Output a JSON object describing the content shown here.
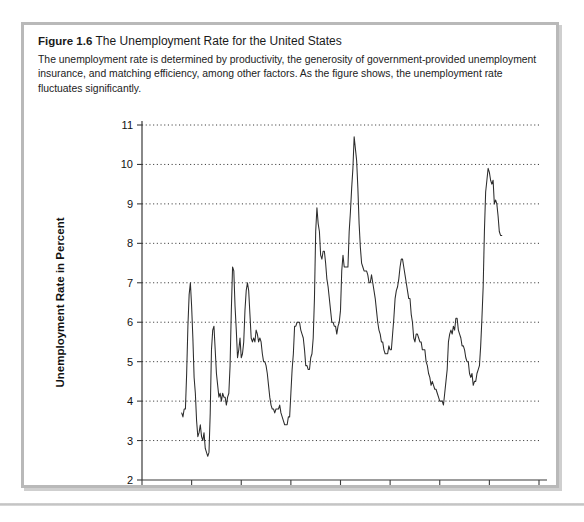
{
  "figure": {
    "number_label": "Figure 1.6",
    "title": "The Unemployment Rate for the United States",
    "description": "The unemployment rate is determined by productivity, the generosity of government-provided unemployment insurance, and matching efficiency, among other factors. As the figure shows, the unemployment rate fluctuates significantly."
  },
  "colors": {
    "card_background": "#ffffff",
    "card_border": "#b9b9b9",
    "line": "#2c2c2c",
    "grid": "#000000",
    "axis": "#3a3a3a",
    "text": "#111111"
  },
  "chart_data": {
    "type": "line",
    "title": "The Unemployment Rate for the United States",
    "xlabel": "Year",
    "ylabel": "Unemployment Rate in Percent",
    "xlim": [
      1940,
      2020
    ],
    "ylim": [
      2,
      11
    ],
    "xticks": [
      1940,
      1950,
      1960,
      1970,
      1980,
      1990,
      2000,
      2010,
      2020
    ],
    "yticks": [
      2,
      3,
      4,
      5,
      6,
      7,
      8,
      9,
      10,
      11
    ],
    "grid": "horizontal-dotted",
    "legend": "none",
    "series": [
      {
        "name": "Unemployment Rate",
        "x": [
          1948.0,
          1948.25,
          1948.5,
          1948.75,
          1949.0,
          1949.25,
          1949.5,
          1949.75,
          1950.0,
          1950.25,
          1950.5,
          1950.75,
          1951.0,
          1951.25,
          1951.5,
          1951.75,
          1952.0,
          1952.25,
          1952.5,
          1952.75,
          1953.0,
          1953.25,
          1953.5,
          1953.75,
          1954.0,
          1954.25,
          1954.5,
          1954.75,
          1955.0,
          1955.25,
          1955.5,
          1955.75,
          1956.0,
          1956.25,
          1956.5,
          1956.75,
          1957.0,
          1957.25,
          1957.5,
          1957.75,
          1958.0,
          1958.25,
          1958.5,
          1958.75,
          1959.0,
          1959.25,
          1959.5,
          1959.75,
          1960.0,
          1960.25,
          1960.5,
          1960.75,
          1961.0,
          1961.25,
          1961.5,
          1961.75,
          1962.0,
          1962.25,
          1962.5,
          1962.75,
          1963.0,
          1963.25,
          1963.5,
          1963.75,
          1964.0,
          1964.25,
          1964.5,
          1964.75,
          1965.0,
          1965.25,
          1965.5,
          1965.75,
          1966.0,
          1966.25,
          1966.5,
          1966.75,
          1967.0,
          1967.25,
          1967.5,
          1967.75,
          1968.0,
          1968.25,
          1968.5,
          1968.75,
          1969.0,
          1969.25,
          1969.5,
          1969.75,
          1970.0,
          1970.25,
          1970.5,
          1970.75,
          1971.0,
          1971.25,
          1971.5,
          1971.75,
          1972.0,
          1972.25,
          1972.5,
          1972.75,
          1973.0,
          1973.25,
          1973.5,
          1973.75,
          1974.0,
          1974.25,
          1974.5,
          1974.75,
          1975.0,
          1975.25,
          1975.5,
          1975.75,
          1976.0,
          1976.25,
          1976.5,
          1976.75,
          1977.0,
          1977.25,
          1977.5,
          1977.75,
          1978.0,
          1978.25,
          1978.5,
          1978.75,
          1979.0,
          1979.25,
          1979.5,
          1979.75,
          1980.0,
          1980.25,
          1980.5,
          1980.75,
          1981.0,
          1981.25,
          1981.5,
          1981.75,
          1982.0,
          1982.25,
          1982.5,
          1982.75,
          1983.0,
          1983.25,
          1983.5,
          1983.75,
          1984.0,
          1984.25,
          1984.5,
          1984.75,
          1985.0,
          1985.25,
          1985.5,
          1985.75,
          1986.0,
          1986.25,
          1986.5,
          1986.75,
          1987.0,
          1987.25,
          1987.5,
          1987.75,
          1988.0,
          1988.25,
          1988.5,
          1988.75,
          1989.0,
          1989.25,
          1989.5,
          1989.75,
          1990.0,
          1990.25,
          1990.5,
          1990.75,
          1991.0,
          1991.25,
          1991.5,
          1991.75,
          1992.0,
          1992.25,
          1992.5,
          1992.75,
          1993.0,
          1993.25,
          1993.5,
          1993.75,
          1994.0,
          1994.25,
          1994.5,
          1994.75,
          1995.0,
          1995.25,
          1995.5,
          1995.75,
          1996.0,
          1996.25,
          1996.5,
          1996.75,
          1997.0,
          1997.25,
          1997.5,
          1997.75,
          1998.0,
          1998.25,
          1998.5,
          1998.75,
          1999.0,
          1999.25,
          1999.5,
          1999.75,
          2000.0,
          2000.25,
          2000.5,
          2000.75,
          2001.0,
          2001.25,
          2001.5,
          2001.75,
          2002.0,
          2002.25,
          2002.5,
          2002.75,
          2003.0,
          2003.25,
          2003.5,
          2003.75,
          2004.0,
          2004.25,
          2004.5,
          2004.75,
          2005.0,
          2005.25,
          2005.5,
          2005.75,
          2006.0,
          2006.25,
          2006.5,
          2006.75,
          2007.0,
          2007.25,
          2007.5,
          2007.75,
          2008.0,
          2008.25,
          2008.5,
          2008.75,
          2009.0,
          2009.25,
          2009.5,
          2009.75,
          2010.0,
          2010.25,
          2010.5,
          2010.75,
          2011.0,
          2011.25,
          2011.5,
          2011.75,
          2012.0,
          2012.25,
          2012.5
        ],
        "values": [
          3.7,
          3.6,
          3.8,
          3.8,
          4.7,
          5.9,
          6.7,
          7.0,
          6.4,
          5.6,
          4.6,
          4.2,
          3.5,
          3.1,
          3.2,
          3.4,
          3.1,
          3.0,
          3.2,
          2.8,
          2.7,
          2.6,
          2.7,
          3.7,
          5.3,
          5.8,
          5.9,
          5.3,
          4.7,
          4.4,
          4.1,
          4.2,
          4.0,
          4.2,
          4.1,
          4.1,
          3.9,
          4.1,
          4.2,
          4.9,
          6.3,
          7.4,
          7.3,
          6.4,
          5.8,
          5.1,
          5.3,
          5.6,
          5.1,
          5.2,
          5.5,
          6.3,
          6.8,
          7.0,
          6.8,
          6.2,
          5.6,
          5.5,
          5.6,
          5.5,
          5.8,
          5.7,
          5.5,
          5.6,
          5.5,
          5.2,
          5.0,
          5.0,
          4.9,
          4.7,
          4.4,
          4.1,
          3.9,
          3.8,
          3.8,
          3.7,
          3.8,
          3.8,
          3.8,
          3.9,
          3.7,
          3.6,
          3.5,
          3.4,
          3.4,
          3.4,
          3.6,
          3.6,
          4.2,
          4.8,
          5.2,
          5.9,
          5.9,
          6.0,
          6.0,
          6.0,
          5.8,
          5.7,
          5.6,
          5.3,
          4.9,
          4.9,
          4.8,
          4.8,
          5.1,
          5.2,
          5.6,
          6.6,
          8.3,
          8.9,
          8.5,
          8.3,
          7.7,
          7.6,
          7.8,
          7.8,
          7.5,
          7.1,
          6.9,
          6.6,
          6.3,
          6.0,
          6.0,
          5.9,
          5.9,
          5.7,
          5.9,
          6.0,
          6.3,
          7.3,
          7.7,
          7.4,
          7.4,
          7.4,
          7.4,
          8.3,
          8.8,
          9.4,
          9.9,
          10.7,
          10.4,
          10.1,
          9.4,
          8.5,
          7.9,
          7.5,
          7.4,
          7.3,
          7.3,
          7.3,
          7.2,
          7.0,
          7.0,
          7.2,
          7.0,
          6.8,
          6.6,
          6.3,
          6.0,
          5.8,
          5.7,
          5.5,
          5.5,
          5.3,
          5.2,
          5.2,
          5.2,
          5.4,
          5.3,
          5.3,
          5.7,
          6.1,
          6.6,
          6.8,
          6.9,
          7.1,
          7.4,
          7.6,
          7.6,
          7.4,
          7.2,
          7.0,
          6.8,
          6.6,
          6.6,
          6.2,
          6.0,
          5.6,
          5.5,
          5.7,
          5.7,
          5.6,
          5.5,
          5.5,
          5.3,
          5.3,
          5.3,
          5.0,
          4.9,
          4.7,
          4.6,
          4.4,
          4.5,
          4.4,
          4.3,
          4.3,
          4.2,
          4.1,
          4.0,
          4.0,
          4.0,
          3.9,
          4.2,
          4.5,
          4.8,
          5.5,
          5.7,
          5.8,
          5.7,
          5.9,
          5.8,
          6.1,
          6.1,
          5.8,
          5.7,
          5.6,
          5.4,
          5.4,
          5.3,
          5.1,
          5.0,
          5.0,
          4.7,
          4.6,
          4.7,
          4.4,
          4.5,
          4.5,
          4.7,
          4.8,
          4.9,
          5.4,
          6.1,
          6.9,
          8.3,
          9.3,
          9.6,
          9.9,
          9.8,
          9.6,
          9.5,
          9.6,
          9.0,
          9.1,
          9.0,
          8.7,
          8.3,
          8.2,
          8.2
        ]
      }
    ]
  }
}
